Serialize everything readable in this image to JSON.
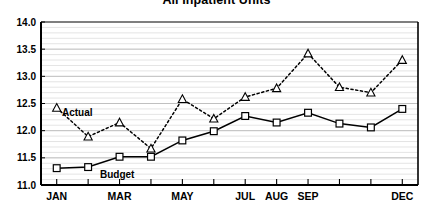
{
  "chart": {
    "title": "All Inpatient Units"
  },
  "series_labels": {
    "actual": "Actual",
    "budget": "Budget"
  },
  "chart_data": {
    "type": "line",
    "title": "All Inpatient Units",
    "xlabel": "",
    "ylabel": "",
    "ylim": [
      11.0,
      14.0
    ],
    "ytick_labels": [
      "11.0",
      "11.5",
      "12.0",
      "12.5",
      "13.0",
      "13.5",
      "14.0"
    ],
    "ytick_values": [
      11.0,
      11.5,
      12.0,
      12.5,
      13.0,
      13.5,
      14.0
    ],
    "grid": true,
    "grid_minor_step": 0.1,
    "legend_position": "inline-annotations",
    "categories": [
      "JAN",
      "FEB",
      "MAR",
      "APR",
      "MAY",
      "JUN",
      "JUL",
      "AUG",
      "SEP",
      "OCT",
      "NOV",
      "DEC"
    ],
    "xtick_labels": [
      "JAN",
      "",
      "MAR",
      "",
      "MAY",
      "",
      "JUL",
      "AUG",
      "SEP",
      "",
      "",
      "DEC"
    ],
    "series": [
      {
        "name": "Actual",
        "marker": "triangle-open",
        "line_style": "dotted",
        "color": "#000000",
        "values": [
          12.42,
          11.89,
          12.15,
          11.67,
          12.58,
          12.22,
          12.62,
          12.78,
          13.42,
          12.8,
          12.7,
          13.3
        ]
      },
      {
        "name": "Budget",
        "marker": "square-open",
        "line_style": "solid",
        "color": "#000000",
        "values": [
          11.31,
          11.33,
          11.52,
          11.52,
          11.82,
          11.99,
          12.27,
          12.15,
          12.33,
          12.13,
          12.06,
          12.4
        ]
      }
    ]
  }
}
